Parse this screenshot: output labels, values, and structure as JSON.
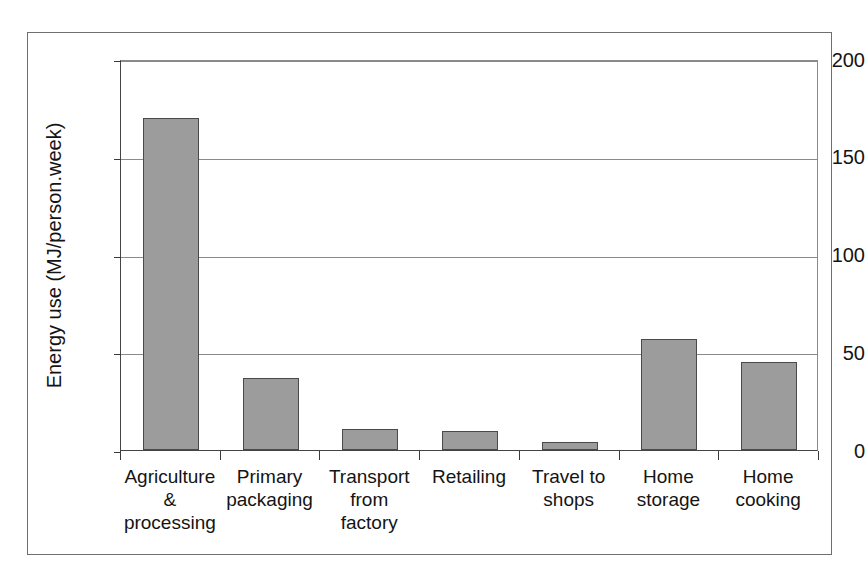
{
  "chart_data": {
    "type": "bar",
    "title": "",
    "subtitle": "",
    "xlabel": "",
    "ylabel": "Energy use (MJ/person.week)",
    "categories": [
      "Agriculture & processing",
      "Primary packaging",
      "Transport from factory",
      "Retailing",
      "Travel to shops",
      "Home storage",
      "Home cooking"
    ],
    "category_lines": [
      [
        "Agriculture",
        "&",
        "processing"
      ],
      [
        "Primary",
        "packaging"
      ],
      [
        "Transport",
        "from factory"
      ],
      [
        "Retailing"
      ],
      [
        "Travel to",
        "shops"
      ],
      [
        "Home",
        "storage"
      ],
      [
        "Home",
        "cooking"
      ]
    ],
    "values": [
      170,
      37,
      11,
      9.5,
      4,
      57,
      45
    ],
    "ylim": [
      0,
      200
    ],
    "yticks": [
      0,
      50,
      100,
      150,
      200
    ],
    "ytick_labels": [
      "0",
      "50",
      "100",
      "150",
      "200"
    ],
    "grid": "horizontal",
    "legend": "none",
    "bar_color": "#9c9c9c",
    "bar_border_color": "#4a4a4a",
    "axis_color": "#3a3a3a",
    "gridline_color": "#8a8a8a",
    "frame_color": "#6f6f6f",
    "background": "#ffffff"
  }
}
